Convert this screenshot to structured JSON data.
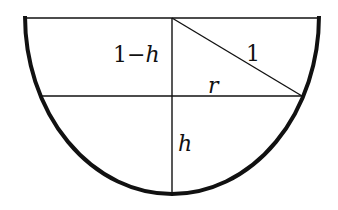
{
  "figure": {
    "colors": {
      "background": "#ffffff",
      "stroke": "#111111"
    },
    "geometry": {
      "center": [
        172,
        18
      ],
      "rx": 147,
      "ry": 178,
      "water_level_y": 96,
      "water_left_x": 40,
      "water_right_x": 303,
      "bottom_y": 196
    },
    "labels": {
      "one_minus_h": {
        "num": "1",
        "minus": "−",
        "var": "h"
      },
      "hypotenuse": "1",
      "radius": "r",
      "depth": "h"
    }
  }
}
